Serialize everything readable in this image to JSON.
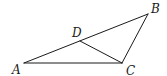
{
  "diagram": {
    "type": "geometry-triangle",
    "stroke_color": "#1a1a1a",
    "background": "#ffffff",
    "points": {
      "A": {
        "label": "A",
        "x": 24,
        "y": 63,
        "lx": 12,
        "ly": 74
      },
      "B": {
        "label": "B",
        "x": 148,
        "y": 14,
        "lx": 151,
        "ly": 13
      },
      "C": {
        "label": "C",
        "x": 122,
        "y": 63,
        "lx": 126,
        "ly": 75
      },
      "D": {
        "label": "D",
        "x": 80,
        "y": 41,
        "lx": 72,
        "ly": 37
      }
    },
    "segments": [
      {
        "name": "AB",
        "from": "A",
        "to": "B"
      },
      {
        "name": "BC",
        "from": "B",
        "to": "C"
      },
      {
        "name": "AC",
        "from": "A",
        "to": "C"
      },
      {
        "name": "DC",
        "from": "D",
        "to": "C"
      }
    ]
  }
}
